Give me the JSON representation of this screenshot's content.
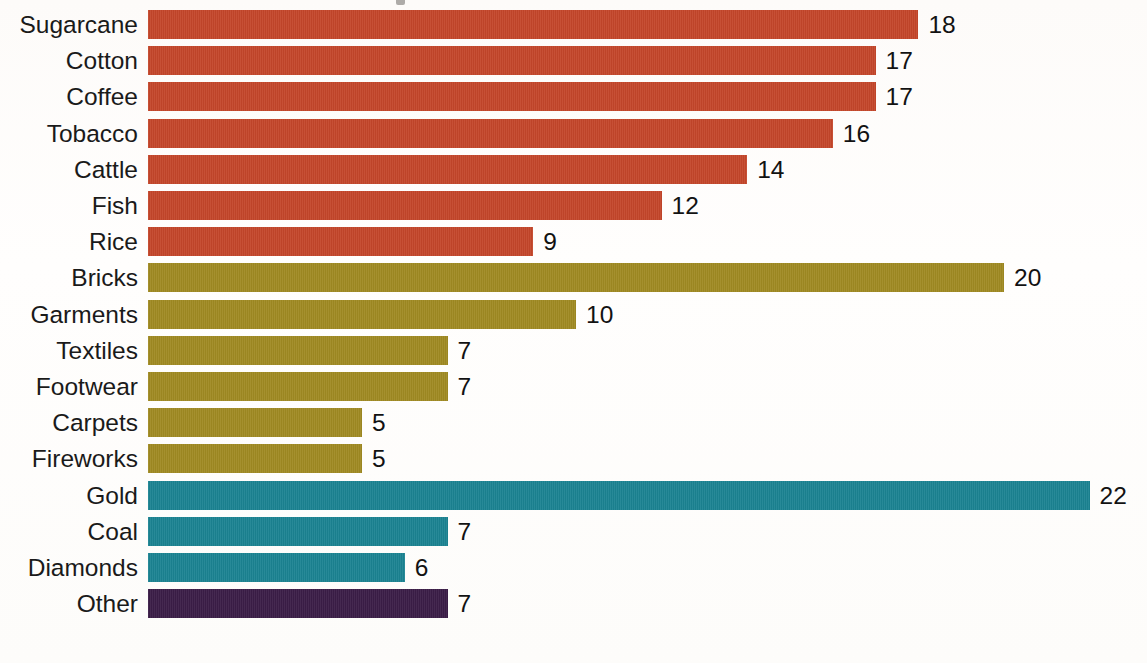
{
  "chart_data": {
    "type": "bar",
    "orientation": "horizontal",
    "title": "",
    "xlabel": "",
    "ylabel": "",
    "grid": false,
    "legend": "none",
    "xlim": [
      0,
      23
    ],
    "value_labels_shown": true,
    "categories": [
      "Sugarcane",
      "Cotton",
      "Coffee",
      "Tobacco",
      "Cattle",
      "Fish",
      "Rice",
      "Bricks",
      "Garments",
      "Textiles",
      "Footwear",
      "Carpets",
      "Fireworks",
      "Gold",
      "Coal",
      "Diamonds",
      "Other"
    ],
    "values": [
      18,
      17,
      17,
      16,
      14,
      12,
      9,
      20,
      10,
      7,
      7,
      5,
      5,
      22,
      7,
      6,
      7
    ],
    "bars": [
      {
        "label": "Sugarcane",
        "value": 18,
        "value_text": "18",
        "group": "agriculture",
        "color": "#C4462A"
      },
      {
        "label": "Cotton",
        "value": 17,
        "value_text": "17",
        "group": "agriculture",
        "color": "#C4462A"
      },
      {
        "label": "Coffee",
        "value": 17,
        "value_text": "17",
        "group": "agriculture",
        "color": "#C4462A"
      },
      {
        "label": "Tobacco",
        "value": 16,
        "value_text": "16",
        "group": "agriculture",
        "color": "#C4462A"
      },
      {
        "label": "Cattle",
        "value": 14,
        "value_text": "14",
        "group": "agriculture",
        "color": "#C4462A"
      },
      {
        "label": "Fish",
        "value": 12,
        "value_text": "12",
        "group": "agriculture",
        "color": "#C4462A"
      },
      {
        "label": "Rice",
        "value": 9,
        "value_text": "9",
        "group": "agriculture",
        "color": "#C4462A"
      },
      {
        "label": "Bricks",
        "value": 20,
        "value_text": "20",
        "group": "manufacturing",
        "color": "#A08A22"
      },
      {
        "label": "Garments",
        "value": 10,
        "value_text": "10",
        "group": "manufacturing",
        "color": "#A08A22"
      },
      {
        "label": "Textiles",
        "value": 7,
        "value_text": "7",
        "group": "manufacturing",
        "color": "#A08A22"
      },
      {
        "label": "Footwear",
        "value": 7,
        "value_text": "7",
        "group": "manufacturing",
        "color": "#A08A22"
      },
      {
        "label": "Carpets",
        "value": 5,
        "value_text": "5",
        "group": "manufacturing",
        "color": "#A08A22"
      },
      {
        "label": "Fireworks",
        "value": 5,
        "value_text": "5",
        "group": "manufacturing",
        "color": "#A08A22"
      },
      {
        "label": "Gold",
        "value": 22,
        "value_text": "22",
        "group": "mining",
        "color": "#1B8392"
      },
      {
        "label": "Coal",
        "value": 7,
        "value_text": "7",
        "group": "mining",
        "color": "#1B8392"
      },
      {
        "label": "Diamonds",
        "value": 6,
        "value_text": "6",
        "group": "mining",
        "color": "#1B8392"
      },
      {
        "label": "Other",
        "value": 7,
        "value_text": "7",
        "group": "other",
        "color": "#3B1D47"
      }
    ],
    "group_colors": {
      "agriculture": "#C4462A",
      "manufacturing": "#A08A22",
      "mining": "#1B8392",
      "other": "#3B1D47"
    }
  },
  "layout": {
    "bar_origin_x": 148,
    "first_row_y": 10,
    "row_pitch": 36.2,
    "bar_height": 29,
    "px_per_unit": 42.8,
    "value_gap": 10,
    "background_color": "#fdfbf8"
  }
}
